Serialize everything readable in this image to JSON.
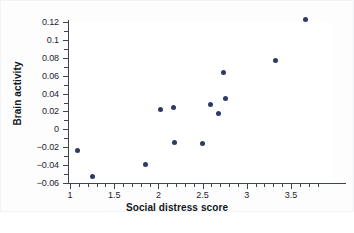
{
  "chart_data": {
    "type": "scatter",
    "title": "",
    "xlabel": "Social distress score",
    "ylabel": "Brain activity",
    "xlim": [
      0.94,
      3.8
    ],
    "ylim": [
      -0.06,
      0.125
    ],
    "grid": false,
    "legend": "none",
    "marker_color": "#2e3a63",
    "axis_color": "#3c4454",
    "background": "#ffffff",
    "xticks": [
      1,
      1.5,
      2,
      2.5,
      3,
      3.5
    ],
    "xtick_labels": [
      "1",
      "1.5",
      "2",
      "2.5",
      "3",
      "3.5"
    ],
    "xminor_step": 0.1,
    "yticks": [
      0.12,
      0.1,
      0.08,
      0.06,
      0.04,
      0.02,
      0,
      -0.02,
      -0.04,
      -0.06
    ],
    "ytick_labels": [
      "0.12",
      "0.1",
      "0.08",
      "0.06",
      "0.04",
      "0.02",
      "0",
      "−0.02",
      "−0.04",
      "−0.06"
    ],
    "yminor_step": 0.01,
    "points": [
      {
        "x": 1.09,
        "y": -0.024
      },
      {
        "x": 1.25,
        "y": -0.053
      },
      {
        "x": 1.85,
        "y": -0.039
      },
      {
        "x": 2.02,
        "y": 0.022
      },
      {
        "x": 2.17,
        "y": 0.024
      },
      {
        "x": 2.18,
        "y": -0.015
      },
      {
        "x": 2.5,
        "y": -0.016
      },
      {
        "x": 2.59,
        "y": 0.028
      },
      {
        "x": 2.68,
        "y": 0.018
      },
      {
        "x": 2.74,
        "y": 0.064
      },
      {
        "x": 2.76,
        "y": 0.035
      },
      {
        "x": 3.33,
        "y": 0.077
      },
      {
        "x": 3.66,
        "y": 0.123
      }
    ]
  }
}
